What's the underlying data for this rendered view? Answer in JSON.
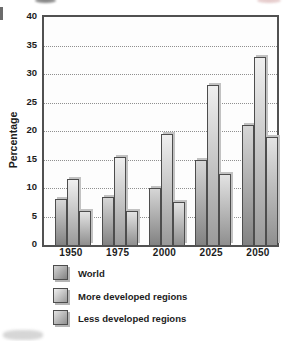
{
  "chart_data": {
    "type": "bar",
    "title": "",
    "xlabel": "",
    "ylabel": "Percentage",
    "categories": [
      "1950",
      "1975",
      "2000",
      "2025",
      "2050"
    ],
    "series": [
      {
        "name": "World",
        "values": [
          8,
          8.5,
          10,
          15,
          21
        ],
        "fill_top": "#d6d6d6",
        "fill_bottom": "#828282"
      },
      {
        "name": "More developed regions",
        "values": [
          11.5,
          15.5,
          19.5,
          28,
          33
        ],
        "fill_top": "#efefef",
        "fill_bottom": "#9a9a9a"
      },
      {
        "name": "Less developed regions",
        "values": [
          6,
          6,
          7.5,
          12.5,
          19
        ],
        "fill_top": "#e3e3e3",
        "fill_bottom": "#8f8f8f"
      }
    ],
    "ylim": [
      0,
      40
    ],
    "yticks": [
      0,
      5,
      10,
      15,
      20,
      25,
      30,
      35,
      40
    ],
    "grid": "horizontal-dotted",
    "legend_position": "bottom-left"
  },
  "colors": {
    "plot_border": "#515151",
    "grid": "#8f8f8f",
    "text": "#1c1c1c",
    "bar_border": "#4d4d4d",
    "bar_shadow": "#c2c2c2",
    "background": "#ffffff"
  }
}
